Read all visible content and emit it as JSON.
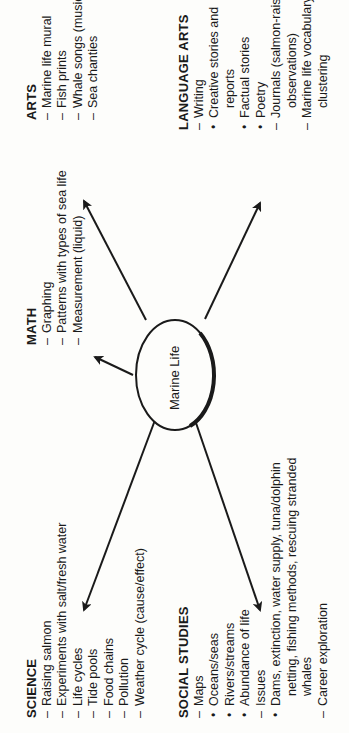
{
  "diagram": {
    "orientation": "rotated 90 degrees counter-clockwise",
    "center": {
      "label": "Marine Life"
    },
    "colors": {
      "ink": "#1a1a1a",
      "background": "#fdfdfb"
    },
    "branches": [
      {
        "id": "science",
        "title": "SCIENCE",
        "items": [
          {
            "type": "dash",
            "text": "Raising salmon"
          },
          {
            "type": "dash",
            "text": "Experiments with salt/fresh water"
          },
          {
            "type": "dash",
            "text": "Life cycles"
          },
          {
            "type": "dash",
            "text": "Tide pools"
          },
          {
            "type": "dash",
            "text": "Food chains"
          },
          {
            "type": "dash",
            "text": "Pollution"
          },
          {
            "type": "dash",
            "text": "Weather cycle (cause/effect)"
          }
        ]
      },
      {
        "id": "math",
        "title": "MATH",
        "items": [
          {
            "type": "dash",
            "text": "Graphing"
          },
          {
            "type": "dash",
            "text": "Patterns with types of sea life"
          },
          {
            "type": "dash",
            "text": "Measurement (liquid)"
          }
        ]
      },
      {
        "id": "arts",
        "title": "ARTS",
        "items": [
          {
            "type": "dash",
            "text": "Marine life mural"
          },
          {
            "type": "dash",
            "text": "Fish prints"
          },
          {
            "type": "dash",
            "text": "Whale songs (music)"
          },
          {
            "type": "dash",
            "text": "Sea chanties"
          }
        ]
      },
      {
        "id": "social-studies",
        "title": "SOCIAL STUDIES",
        "items": [
          {
            "type": "dash",
            "text": "Maps"
          },
          {
            "type": "bullet",
            "text": "Oceans/seas"
          },
          {
            "type": "bullet",
            "text": "Rivers/streams"
          },
          {
            "type": "bullet",
            "text": "Abundance of life"
          },
          {
            "type": "dash",
            "text": "Issues"
          },
          {
            "type": "bullet",
            "text": "Dams, extinction, water supply, tuna/dolphin"
          },
          {
            "type": "cont",
            "text": "netting, fishing methods, rescuing stranded"
          },
          {
            "type": "cont",
            "text": "whales"
          },
          {
            "type": "dash",
            "text": "Career exploration"
          }
        ]
      },
      {
        "id": "language-arts",
        "title": "LANGUAGE ARTS",
        "items": [
          {
            "type": "dash",
            "text": "Writing"
          },
          {
            "type": "bullet",
            "text": "Creative stories and"
          },
          {
            "type": "cont",
            "text": "reports"
          },
          {
            "type": "bullet",
            "text": "Factual stories"
          },
          {
            "type": "bullet",
            "text": "Poetry"
          },
          {
            "type": "dash",
            "text": "Journals (salmon-raising"
          },
          {
            "type": "cont",
            "text": "observations)"
          },
          {
            "type": "dash",
            "text": "Marine life vocabulary"
          },
          {
            "type": "cont",
            "text": "clustering"
          }
        ]
      }
    ],
    "arrows": [
      {
        "to": "science",
        "direction": "upper-left"
      },
      {
        "to": "math",
        "direction": "up"
      },
      {
        "to": "arts",
        "direction": "upper-right"
      },
      {
        "to": "social-studies",
        "direction": "lower-left"
      },
      {
        "to": "language-arts",
        "direction": "lower-right"
      }
    ]
  }
}
